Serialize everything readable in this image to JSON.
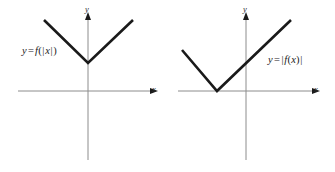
{
  "figure": {
    "width": 335,
    "height": 172,
    "background": "#ffffff",
    "curve_color": "#1a1a1a",
    "axis_color": "#8c8c8c",
    "text_color": "#1a1a1a"
  },
  "panels": [
    {
      "id": "left",
      "equation": {
        "lhs": "y",
        "equals": "=",
        "fn": "f",
        "open_paren": "(",
        "left_bar": "|",
        "arg": "x",
        "right_bar": "|",
        "close_paren": ")",
        "plain": "y = f(|x|)"
      },
      "axes": {
        "x_label": "x",
        "y_label": "y"
      },
      "description": "V-shaped graph with vertex on the y-axis above the x-axis; symmetric about the y-axis"
    },
    {
      "id": "right",
      "equation": {
        "lhs": "y",
        "equals": "=",
        "left_bar": "|",
        "fn": "f",
        "open_paren": "(",
        "arg": "x",
        "close_paren": ")",
        "right_bar": "|",
        "plain": "y = |f(x)|"
      },
      "axes": {
        "x_label": "x",
        "y_label": "y"
      },
      "description": "V-shaped graph with vertex touching the x-axis to the left of the y-axis"
    }
  ],
  "chart_data": {
    "type": "line",
    "title": "",
    "xlabel": "x",
    "ylabel": "y",
    "grid": false,
    "legend": "none",
    "charts": [
      {
        "name": "y = f(|x|)",
        "origin_px": {
          "x": 88,
          "y": 91
        },
        "axis_x_px": {
          "x1": 18,
          "x2": 150,
          "y": 91
        },
        "axis_y_px": {
          "y1": 16,
          "y2": 160,
          "x": 88
        },
        "points_px": [
          {
            "x": 44,
            "y": 20
          },
          {
            "x": 88,
            "y": 63
          },
          {
            "x": 133,
            "y": 20
          }
        ],
        "vertex_px": {
          "x": 88,
          "y": 63
        },
        "vertex_on_axis": "y-axis, above origin",
        "label_px": {
          "x": 22,
          "y": 45
        }
      },
      {
        "name": "y = |f(x)|",
        "origin_px": {
          "x": 246,
          "y": 91
        },
        "axis_x_px": {
          "x1": 178,
          "x2": 312,
          "y": 91
        },
        "axis_y_px": {
          "y1": 16,
          "y2": 160,
          "x": 246
        },
        "points_px": [
          {
            "x": 182,
            "y": 50
          },
          {
            "x": 217,
            "y": 91
          },
          {
            "x": 291,
            "y": 20
          }
        ],
        "vertex_px": {
          "x": 217,
          "y": 91
        },
        "vertex_on_axis": "x-axis, left of origin",
        "label_px": {
          "x": 268,
          "y": 54
        }
      }
    ]
  }
}
